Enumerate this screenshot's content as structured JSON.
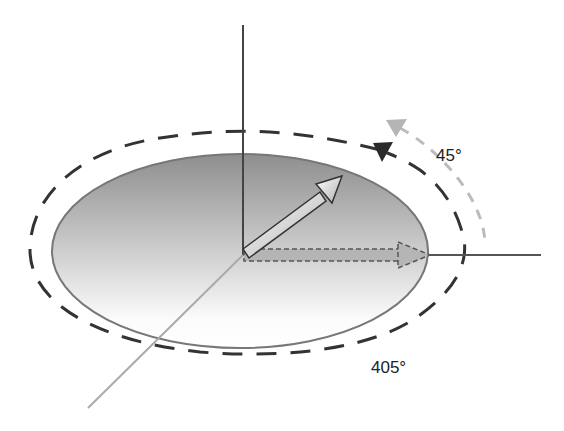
{
  "diagram": {
    "title": "",
    "labels": {
      "angle_start": "45°",
      "angle_end": "405°"
    },
    "colors": {
      "background": "#ffffff",
      "axis_dark": "#444444",
      "axis_light": "#aaaaaa",
      "ellipse_stroke": "#777777",
      "ellipse_fill_top": "#9a9a9a",
      "ellipse_fill_bottom": "#ffffff",
      "dashed_dark": "#333333",
      "dashed_light": "#bbbbbb",
      "triangle_dark": "#2a2a2a",
      "triangle_light": "#b5b5b5"
    },
    "elements": [
      "vertical-axis",
      "horizontal-axis",
      "depth-axis",
      "shaded-ellipse-plane",
      "rotated-vector-arrow",
      "projected-vector-dashed-arrow",
      "dark-dashed-spiral-path",
      "light-dashed-arc-path",
      "dark-start-triangle-marker",
      "light-start-triangle-marker"
    ]
  }
}
